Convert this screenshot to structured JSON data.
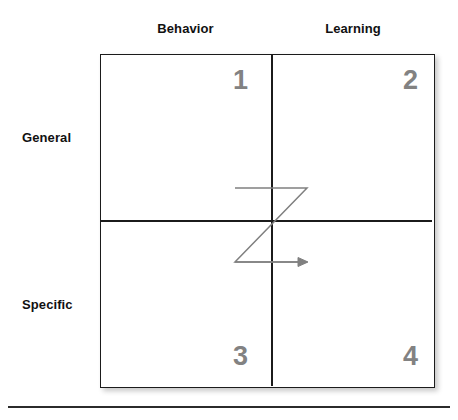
{
  "diagram": {
    "column_headers": [
      {
        "label": "Behavior",
        "name": "behavior"
      },
      {
        "label": "Learning",
        "name": "learning"
      }
    ],
    "row_labels": [
      {
        "label": "General",
        "name": "general"
      },
      {
        "label": "Specific",
        "name": "specific"
      }
    ],
    "quadrants": [
      {
        "number": "1",
        "column": "Behavior",
        "row": "General"
      },
      {
        "number": "2",
        "column": "Learning",
        "row": "General"
      },
      {
        "number": "3",
        "column": "Behavior",
        "row": "Specific"
      },
      {
        "number": "4",
        "column": "Learning",
        "row": "Specific"
      }
    ],
    "flow_arrow": {
      "name": "z-flow-arrow",
      "shape": "z-path",
      "description": "Z-shaped path running 1 to 2 to 3 to 4 with arrowhead at right",
      "color": "#808080"
    },
    "colors": {
      "border": "#1b1b1b",
      "quadrant_number": "#828282",
      "label_text": "#111111",
      "arrow": "#808080",
      "background": "#ffffff",
      "bottom_rule": "#2b2b2b"
    }
  }
}
